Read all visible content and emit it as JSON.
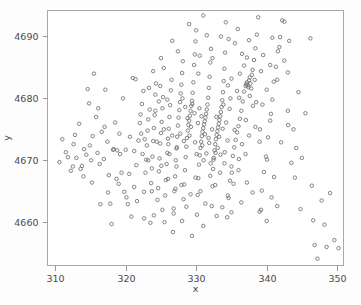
{
  "chart_data": {
    "type": "scatter",
    "title": "",
    "subtitle": "",
    "xlabel": "x",
    "ylabel": "y",
    "xlim": [
      308.9,
      350.9
    ],
    "ylim": [
      4653.0,
      4694.2
    ],
    "xticks": [
      310,
      320,
      330,
      340,
      350
    ],
    "xticklabels": [
      "310",
      "320",
      "330",
      "340",
      "350"
    ],
    "yticks": [
      4660,
      4670,
      4680,
      4690
    ],
    "yticklabels": [
      "4660",
      "4670",
      "4680",
      "4690"
    ],
    "grid": false,
    "legend": null,
    "marker": "open-circle",
    "marker_size": 3,
    "marker_color": "#6f6f6f",
    "background_color": "#ffffff",
    "border_color": "#a8a8a8",
    "n_points": 420,
    "points": [
      [
        310.6,
        4669.7
      ],
      [
        311.5,
        4671.3
      ],
      [
        312.2,
        4668.3
      ],
      [
        312.6,
        4672.6
      ],
      [
        313.0,
        4670.4
      ],
      [
        313.4,
        4675.9
      ],
      [
        313.8,
        4669.1
      ],
      [
        314.1,
        4671.8
      ],
      [
        314.4,
        4670.9
      ],
      [
        314.6,
        4681.5
      ],
      [
        314.8,
        4679.2
      ],
      [
        315.1,
        4670.0
      ],
      [
        315.3,
        4673.9
      ],
      [
        315.5,
        4684.0
      ],
      [
        315.8,
        4677.0
      ],
      [
        316.0,
        4671.2
      ],
      [
        316.3,
        4669.4
      ],
      [
        316.6,
        4674.6
      ],
      [
        316.9,
        4670.2
      ],
      [
        317.1,
        4681.4
      ],
      [
        317.4,
        4673.0
      ],
      [
        317.6,
        4667.6
      ],
      [
        317.8,
        4663.0
      ],
      [
        318.0,
        4659.7
      ],
      [
        318.2,
        4671.7
      ],
      [
        318.3,
        4671.8
      ],
      [
        318.5,
        4676.1
      ],
      [
        318.8,
        4671.6
      ],
      [
        319.1,
        4674.3
      ],
      [
        319.4,
        4668.0
      ],
      [
        319.6,
        4680.0
      ],
      [
        319.8,
        4664.9
      ],
      [
        320.0,
        4671.7
      ],
      [
        320.3,
        4662.9
      ],
      [
        320.5,
        4667.8
      ],
      [
        320.8,
        4660.9
      ],
      [
        321.0,
        4683.3
      ],
      [
        321.2,
        4671.5
      ],
      [
        321.4,
        4683.1
      ],
      [
        321.6,
        4663.4
      ],
      [
        321.8,
        4673.2
      ],
      [
        322.0,
        4676.0
      ],
      [
        322.1,
        4677.4
      ],
      [
        322.3,
        4679.1
      ],
      [
        322.5,
        4681.2
      ],
      [
        322.6,
        4664.9
      ],
      [
        322.8,
        4668.0
      ],
      [
        322.9,
        4670.1
      ],
      [
        323.0,
        4672.4
      ],
      [
        323.1,
        4674.8
      ],
      [
        323.2,
        4676.6
      ],
      [
        323.4,
        4678.2
      ],
      [
        323.5,
        4659.9
      ],
      [
        323.6,
        4666.3
      ],
      [
        323.7,
        4668.7
      ],
      [
        323.8,
        4670.6
      ],
      [
        323.9,
        4673.1
      ],
      [
        324.0,
        4675.2
      ],
      [
        324.1,
        4677.3
      ],
      [
        324.2,
        4680.6
      ],
      [
        324.3,
        4682.4
      ],
      [
        324.5,
        4663.6
      ],
      [
        324.6,
        4665.5
      ],
      [
        324.7,
        4668.2
      ],
      [
        324.8,
        4670.3
      ],
      [
        324.9,
        4672.7
      ],
      [
        325.0,
        4674.4
      ],
      [
        325.1,
        4676.2
      ],
      [
        325.2,
        4678.4
      ],
      [
        325.3,
        4680.2
      ],
      [
        325.4,
        4684.9
      ],
      [
        325.5,
        4660.0
      ],
      [
        325.6,
        4664.3
      ],
      [
        325.7,
        4666.8
      ],
      [
        325.8,
        4669.4
      ],
      [
        325.9,
        4671.2
      ],
      [
        326.0,
        4673.5
      ],
      [
        326.1,
        4675.1
      ],
      [
        326.2,
        4677.0
      ],
      [
        326.3,
        4678.9
      ],
      [
        326.4,
        4681.3
      ],
      [
        326.5,
        4683.0
      ],
      [
        326.6,
        4689.3
      ],
      [
        326.7,
        4658.4
      ],
      [
        326.8,
        4662.2
      ],
      [
        326.9,
        4665.0
      ],
      [
        327.0,
        4667.4
      ],
      [
        327.1,
        4670.0
      ],
      [
        327.2,
        4671.9
      ],
      [
        327.3,
        4673.8
      ],
      [
        327.4,
        4675.6
      ],
      [
        327.5,
        4676.9
      ],
      [
        327.6,
        4678.1
      ],
      [
        327.7,
        4679.4
      ],
      [
        327.8,
        4680.8
      ],
      [
        327.9,
        4682.2
      ],
      [
        328.0,
        4684.1
      ],
      [
        328.1,
        4686.0
      ],
      [
        328.2,
        4663.7
      ],
      [
        328.3,
        4666.1
      ],
      [
        328.4,
        4668.4
      ],
      [
        328.5,
        4670.5
      ],
      [
        328.6,
        4672.2
      ],
      [
        328.7,
        4673.6
      ],
      [
        328.8,
        4674.8
      ],
      [
        328.9,
        4675.7
      ],
      [
        329.0,
        4676.4
      ],
      [
        329.1,
        4677.2
      ],
      [
        329.2,
        4678.0
      ],
      [
        329.3,
        4678.8
      ],
      [
        329.4,
        4679.6
      ],
      [
        329.5,
        4680.9
      ],
      [
        329.6,
        4682.6
      ],
      [
        329.7,
        4685.4
      ],
      [
        329.8,
        4687.1
      ],
      [
        329.9,
        4689.2
      ],
      [
        330.0,
        4691.0
      ],
      [
        330.1,
        4661.2
      ],
      [
        330.2,
        4664.4
      ],
      [
        330.3,
        4667.1
      ],
      [
        330.4,
        4669.3
      ],
      [
        330.5,
        4670.8
      ],
      [
        330.6,
        4672.0
      ],
      [
        330.7,
        4673.0
      ],
      [
        330.8,
        4673.9
      ],
      [
        330.9,
        4674.6
      ],
      [
        331.0,
        4675.2
      ],
      [
        331.1,
        4675.8
      ],
      [
        331.2,
        4676.3
      ],
      [
        331.3,
        4676.9
      ],
      [
        331.4,
        4677.5
      ],
      [
        331.5,
        4678.2
      ],
      [
        331.6,
        4679.0
      ],
      [
        331.7,
        4680.1
      ],
      [
        331.8,
        4681.7
      ],
      [
        331.9,
        4683.5
      ],
      [
        332.0,
        4685.8
      ],
      [
        332.1,
        4688.0
      ],
      [
        332.2,
        4662.6
      ],
      [
        332.3,
        4665.8
      ],
      [
        332.4,
        4668.6
      ],
      [
        332.5,
        4670.4
      ],
      [
        332.6,
        4671.6
      ],
      [
        332.7,
        4672.6
      ],
      [
        332.8,
        4673.4
      ],
      [
        332.9,
        4674.1
      ],
      [
        333.0,
        4674.7
      ],
      [
        333.1,
        4675.3
      ],
      [
        333.2,
        4675.9
      ],
      [
        333.3,
        4676.5
      ],
      [
        333.4,
        4677.1
      ],
      [
        333.5,
        4677.8
      ],
      [
        333.6,
        4678.6
      ],
      [
        333.7,
        4679.7
      ],
      [
        333.8,
        4681.0
      ],
      [
        333.9,
        4682.8
      ],
      [
        334.0,
        4684.8
      ],
      [
        334.1,
        4687.4
      ],
      [
        334.2,
        4692.3
      ],
      [
        334.4,
        4660.8
      ],
      [
        334.6,
        4663.9
      ],
      [
        334.8,
        4666.7
      ],
      [
        335.0,
        4669.0
      ],
      [
        335.2,
        4670.7
      ],
      [
        335.4,
        4672.1
      ],
      [
        335.6,
        4673.3
      ],
      [
        335.8,
        4674.5
      ],
      [
        336.0,
        4675.5
      ],
      [
        336.2,
        4676.7
      ],
      [
        336.4,
        4678.0
      ],
      [
        336.6,
        4679.5
      ],
      [
        336.8,
        4681.1
      ],
      [
        337.0,
        4682.0
      ],
      [
        337.1,
        4682.3
      ],
      [
        337.2,
        4682.6
      ],
      [
        337.3,
        4682.1
      ],
      [
        337.4,
        4681.8
      ],
      [
        337.5,
        4682.9
      ],
      [
        337.6,
        4683.4
      ],
      [
        337.7,
        4682.4
      ],
      [
        337.8,
        4681.6
      ],
      [
        337.9,
        4683.8
      ],
      [
        338.0,
        4684.6
      ],
      [
        338.2,
        4686.2
      ],
      [
        338.4,
        4688.1
      ],
      [
        338.6,
        4690.3
      ],
      [
        338.8,
        4693.1
      ],
      [
        339.0,
        4661.7
      ],
      [
        339.3,
        4665.1
      ],
      [
        339.6,
        4668.1
      ],
      [
        339.9,
        4670.6
      ],
      [
        340.2,
        4673.7
      ],
      [
        340.5,
        4676.4
      ],
      [
        340.8,
        4679.8
      ],
      [
        341.0,
        4682.7
      ],
      [
        341.3,
        4685.1
      ],
      [
        341.6,
        4687.6
      ],
      [
        341.9,
        4689.9
      ],
      [
        342.2,
        4692.6
      ],
      [
        342.5,
        4692.4
      ],
      [
        343.0,
        4684.2
      ],
      [
        343.5,
        4669.6
      ],
      [
        344.0,
        4667.2
      ],
      [
        344.8,
        4662.1
      ],
      [
        345.5,
        4677.6
      ],
      [
        346.2,
        4689.7
      ],
      [
        346.4,
        4665.9
      ],
      [
        346.6,
        4660.3
      ],
      [
        346.8,
        4656.3
      ],
      [
        347.2,
        4654.1
      ],
      [
        347.8,
        4663.5
      ],
      [
        348.2,
        4659.6
      ],
      [
        348.5,
        4656.0
      ],
      [
        349.0,
        4664.7
      ],
      [
        349.6,
        4657.1
      ],
      [
        350.2,
        4655.8
      ],
      [
        311.0,
        4673.4
      ],
      [
        312.8,
        4674.1
      ],
      [
        313.6,
        4668.6
      ],
      [
        314.9,
        4672.4
      ],
      [
        316.1,
        4678.4
      ],
      [
        317.0,
        4675.4
      ],
      [
        318.7,
        4667.0
      ],
      [
        319.2,
        4671.0
      ],
      [
        320.6,
        4673.8
      ],
      [
        321.5,
        4669.2
      ],
      [
        322.4,
        4671.0
      ],
      [
        323.3,
        4681.7
      ],
      [
        324.4,
        4673.0
      ],
      [
        325.05,
        4669.1
      ],
      [
        326.05,
        4672.6
      ],
      [
        327.05,
        4665.4
      ],
      [
        328.05,
        4680.0
      ],
      [
        329.05,
        4674.0
      ],
      [
        330.05,
        4671.0
      ],
      [
        331.05,
        4670.0
      ],
      [
        332.05,
        4669.5
      ],
      [
        333.05,
        4672.0
      ],
      [
        334.05,
        4671.3
      ],
      [
        335.05,
        4668.0
      ],
      [
        336.05,
        4670.2
      ],
      [
        337.05,
        4676.5
      ],
      [
        338.05,
        4678.8
      ],
      [
        339.05,
        4675.0
      ],
      [
        340.05,
        4670.1
      ],
      [
        341.05,
        4667.3
      ],
      [
        342.05,
        4672.9
      ],
      [
        343.05,
        4675.7
      ],
      [
        327.25,
        4672.1
      ],
      [
        328.25,
        4673.1
      ],
      [
        329.25,
        4675.4
      ],
      [
        330.25,
        4676.0
      ],
      [
        331.25,
        4674.2
      ],
      [
        332.25,
        4675.0
      ],
      [
        333.25,
        4673.8
      ],
      [
        334.25,
        4676.1
      ],
      [
        327.75,
        4674.3
      ],
      [
        328.75,
        4676.8
      ],
      [
        329.75,
        4677.6
      ],
      [
        330.75,
        4677.1
      ],
      [
        331.75,
        4673.6
      ],
      [
        332.75,
        4671.2
      ],
      [
        333.75,
        4675.1
      ],
      [
        334.75,
        4678.3
      ],
      [
        328.45,
        4678.6
      ],
      [
        329.45,
        4679.1
      ],
      [
        330.45,
        4678.4
      ],
      [
        331.45,
        4671.1
      ],
      [
        332.45,
        4670.1
      ],
      [
        333.45,
        4670.9
      ],
      [
        334.45,
        4673.2
      ],
      [
        335.45,
        4674.9
      ],
      [
        329.85,
        4672.9
      ],
      [
        330.85,
        4672.4
      ],
      [
        331.85,
        4672.8
      ],
      [
        332.85,
        4677.0
      ],
      [
        333.85,
        4679.0
      ],
      [
        334.85,
        4680.0
      ],
      [
        336.5,
        4672.6
      ],
      [
        337.5,
        4674.0
      ],
      [
        326.2,
        4671.0
      ],
      [
        325.9,
        4679.8
      ],
      [
        324.9,
        4682.0
      ],
      [
        323.9,
        4684.4
      ],
      [
        330.5,
        4686.9
      ],
      [
        331.5,
        4690.2
      ],
      [
        333.5,
        4690.0
      ],
      [
        335.5,
        4688.9
      ],
      [
        336.5,
        4687.2
      ],
      [
        337.5,
        4689.4
      ],
      [
        339.5,
        4687.0
      ],
      [
        340.5,
        4685.4
      ],
      [
        341.5,
        4683.0
      ],
      [
        342.5,
        4686.1
      ],
      [
        343.2,
        4689.3
      ],
      [
        344.5,
        4681.0
      ],
      [
        336.2,
        4684.0
      ],
      [
        336.8,
        4685.3
      ],
      [
        337.2,
        4686.6
      ],
      [
        338.3,
        4683.0
      ],
      [
        339.2,
        4684.4
      ],
      [
        340.0,
        4681.4
      ],
      [
        340.8,
        4689.8
      ],
      [
        341.8,
        4688.3
      ],
      [
        335.0,
        4683.2
      ],
      [
        334.5,
        4682.1
      ],
      [
        335.8,
        4681.2
      ],
      [
        336.1,
        4680.1
      ],
      [
        337.6,
        4680.4
      ],
      [
        338.5,
        4679.4
      ],
      [
        339.4,
        4679.0
      ],
      [
        340.6,
        4677.5
      ],
      [
        338.4,
        4675.4
      ],
      [
        339.0,
        4673.0
      ],
      [
        337.0,
        4671.0
      ],
      [
        336.0,
        4668.4
      ],
      [
        335.3,
        4666.2
      ],
      [
        334.5,
        4664.3
      ],
      [
        333.7,
        4662.4
      ],
      [
        332.9,
        4661.0
      ],
      [
        331.0,
        4659.4
      ],
      [
        329.4,
        4657.8
      ],
      [
        328.0,
        4660.2
      ],
      [
        326.8,
        4661.4
      ],
      [
        325.2,
        4662.0
      ],
      [
        324.0,
        4661.1
      ],
      [
        322.6,
        4660.6
      ],
      [
        321.2,
        4665.7
      ],
      [
        320.1,
        4664.0
      ],
      [
        319.0,
        4666.2
      ],
      [
        317.5,
        4664.8
      ],
      [
        316.4,
        4662.9
      ],
      [
        315.2,
        4666.4
      ],
      [
        314.0,
        4667.4
      ],
      [
        312.5,
        4669.0
      ],
      [
        311.8,
        4670.5
      ],
      [
        340.0,
        4660.2
      ],
      [
        340.7,
        4664.0
      ],
      [
        341.5,
        4662.6
      ],
      [
        339.2,
        4662.0
      ],
      [
        338.0,
        4664.8
      ],
      [
        337.2,
        4666.4
      ],
      [
        336.4,
        4663.2
      ],
      [
        335.0,
        4661.6
      ],
      [
        343.8,
        4675.0
      ],
      [
        344.2,
        4672.0
      ],
      [
        345.0,
        4670.4
      ],
      [
        343.0,
        4678.0
      ],
      [
        329.0,
        4692.0
      ],
      [
        331.0,
        4693.4
      ],
      [
        327.4,
        4687.6
      ],
      [
        325.0,
        4686.5
      ],
      [
        330.3,
        4684.0
      ],
      [
        332.3,
        4686.5
      ],
      [
        334.6,
        4689.6
      ],
      [
        335.9,
        4691.2
      ],
      [
        322.2,
        4674.3
      ],
      [
        322.7,
        4673.4
      ],
      [
        323.2,
        4670.0
      ],
      [
        323.7,
        4665.0
      ],
      [
        324.2,
        4678.0
      ],
      [
        324.7,
        4679.5
      ],
      [
        325.4,
        4675.0
      ],
      [
        326.0,
        4667.0
      ],
      [
        326.6,
        4674.0
      ],
      [
        327.2,
        4669.0
      ],
      [
        327.9,
        4666.0
      ],
      [
        328.6,
        4662.5
      ],
      [
        329.2,
        4664.5
      ],
      [
        329.9,
        4667.2
      ],
      [
        330.6,
        4665.0
      ],
      [
        331.3,
        4663.0
      ],
      [
        332.0,
        4667.5
      ],
      [
        332.7,
        4666.0
      ],
      [
        333.4,
        4668.0
      ],
      [
        334.0,
        4669.5
      ]
    ]
  },
  "axes": {
    "x_title": "x",
    "y_title": "y"
  }
}
